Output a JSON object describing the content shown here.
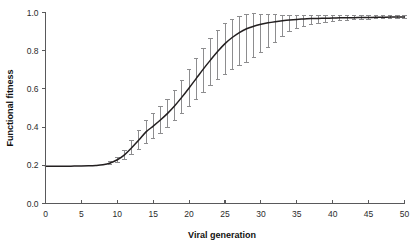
{
  "chart_data": {
    "type": "line",
    "title": "",
    "subtitle": "",
    "xlabel": "Viral generation",
    "ylabel": "Functional fitness",
    "xlim": [
      0,
      50
    ],
    "ylim": [
      0.0,
      1.0
    ],
    "xticks": [
      0,
      5,
      10,
      15,
      20,
      25,
      30,
      35,
      40,
      45,
      50
    ],
    "xtick_labels": [
      "0",
      "5",
      "10",
      "15",
      "20",
      "25",
      "30",
      "35",
      "40",
      "45",
      "50"
    ],
    "yticks": [
      0.0,
      0.2,
      0.4,
      0.6,
      0.8,
      1.0
    ],
    "ytick_labels": [
      "0.0",
      "0.2",
      "0.4",
      "0.6",
      "0.8",
      "1.0"
    ],
    "grid": false,
    "legend": null,
    "legend_position": "none",
    "curve_color": "#231f20",
    "errorbar_color": "#8d8d8f",
    "axis_color": "#59595b",
    "series": [
      {
        "name": "Functional fitness",
        "x": [
          0,
          1,
          2,
          3,
          4,
          5,
          6,
          7,
          8,
          9,
          10,
          11,
          12,
          13,
          14,
          15,
          16,
          17,
          18,
          19,
          20,
          21,
          22,
          23,
          24,
          25,
          26,
          27,
          28,
          29,
          30,
          31,
          32,
          33,
          34,
          35,
          36,
          37,
          38,
          39,
          40,
          41,
          42,
          43,
          44,
          45,
          46,
          47,
          48,
          49,
          50
        ],
        "values": [
          0.195,
          0.195,
          0.195,
          0.195,
          0.196,
          0.196,
          0.197,
          0.199,
          0.203,
          0.212,
          0.229,
          0.255,
          0.292,
          0.332,
          0.375,
          0.405,
          0.437,
          0.472,
          0.512,
          0.557,
          0.605,
          0.655,
          0.705,
          0.752,
          0.797,
          0.837,
          0.869,
          0.895,
          0.915,
          0.928,
          0.938,
          0.946,
          0.952,
          0.957,
          0.961,
          0.964,
          0.966,
          0.968,
          0.969,
          0.97,
          0.971,
          0.972,
          0.973,
          0.973,
          0.974,
          0.974,
          0.975,
          0.975,
          0.976,
          0.976,
          0.977
        ],
        "error_lower": [
          null,
          null,
          null,
          null,
          null,
          null,
          null,
          null,
          null,
          0.206,
          0.216,
          0.231,
          0.255,
          0.283,
          0.313,
          0.339,
          0.366,
          0.398,
          0.432,
          0.47,
          0.508,
          0.546,
          0.58,
          0.617,
          0.65,
          0.678,
          0.7,
          0.721,
          0.739,
          0.762,
          0.792,
          0.818,
          0.845,
          0.875,
          0.898,
          0.915,
          0.928,
          0.938,
          0.945,
          0.95,
          0.954,
          0.957,
          0.96,
          0.962,
          0.964,
          0.965,
          0.967,
          0.968,
          0.969,
          0.97,
          0.971
        ],
        "error_upper": [
          null,
          null,
          null,
          null,
          null,
          null,
          null,
          null,
          null,
          0.219,
          0.243,
          0.28,
          0.33,
          0.382,
          0.434,
          0.472,
          0.508,
          0.547,
          0.592,
          0.645,
          0.7,
          0.757,
          0.812,
          0.862,
          0.906,
          0.94,
          0.962,
          0.979,
          0.99,
          0.993,
          0.992,
          0.99,
          0.988,
          0.986,
          0.985,
          0.984,
          0.983,
          0.982,
          0.982,
          0.982,
          0.982,
          0.982,
          0.982,
          0.982,
          0.982,
          0.982,
          0.982,
          0.982,
          0.982,
          0.982,
          0.982
        ]
      }
    ]
  },
  "axes": {
    "x_title": "Viral generation",
    "y_title": "Functional fitness"
  }
}
